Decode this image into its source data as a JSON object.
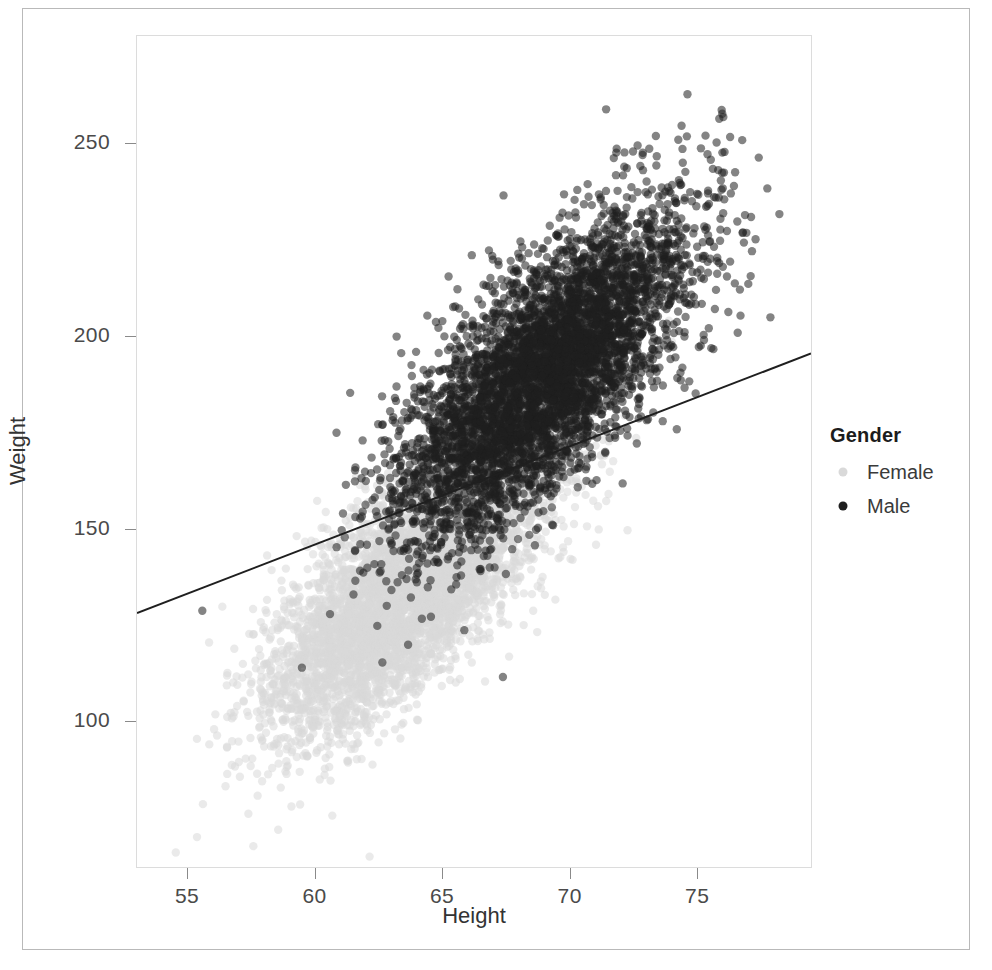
{
  "figure": {
    "caption_partial": "",
    "background_color": "#ffffff",
    "frame_color": "#b9b9b9"
  },
  "chart_data": {
    "type": "scatter",
    "title": "",
    "subtitle": "",
    "xlabel": "Height",
    "ylabel": "Weight",
    "xlim": [
      53.0,
      79.5
    ],
    "ylim": [
      62,
      278
    ],
    "xticks": [
      55,
      60,
      65,
      70,
      75
    ],
    "yticks": [
      100,
      150,
      200,
      250
    ],
    "xtick_labels": [
      "55",
      "60",
      "65",
      "70",
      "75"
    ],
    "ytick_labels": [
      "100",
      "150",
      "200",
      "250"
    ],
    "grid": false,
    "n_points_approx": 10000,
    "legend": {
      "title": "Gender",
      "position": "right",
      "entries": [
        {
          "label": "Female",
          "color": "#d9d9d9",
          "marker": "circle"
        },
        {
          "label": "Male",
          "color": "#1f1f1f",
          "marker": "circle"
        }
      ]
    },
    "series": [
      {
        "name": "Female",
        "color": "#d9d9d9",
        "marker": "circle",
        "point_size": 6,
        "opacity": 0.55,
        "n": 5000,
        "x_mean": 63.7,
        "x_sd": 2.7,
        "y_mean": 135.0,
        "y_sd": 19.0,
        "correlation": 0.73,
        "x_range": [
          54.3,
          72.2
        ],
        "y_range": [
          65,
          200
        ]
      },
      {
        "name": "Male",
        "color": "#1f1f1f",
        "marker": "circle",
        "point_size": 6,
        "opacity": 0.55,
        "n": 5000,
        "x_mean": 69.0,
        "x_sd": 2.8,
        "y_mean": 190.0,
        "y_sd": 21.0,
        "correlation": 0.72,
        "x_range": [
          59.5,
          79.0
        ],
        "y_range": [
          128,
          268
        ]
      }
    ],
    "fit_line": {
      "name": "overall-regression-line",
      "color": "#1f1f1f",
      "width": 2,
      "x_start": 53.0,
      "y_start": 128.0,
      "x_end": 79.5,
      "y_end": 195.5,
      "slope": 2.55,
      "intercept": -7.1
    },
    "annotations": []
  },
  "axis": {
    "x_title": "Height",
    "y_title": "Weight"
  }
}
